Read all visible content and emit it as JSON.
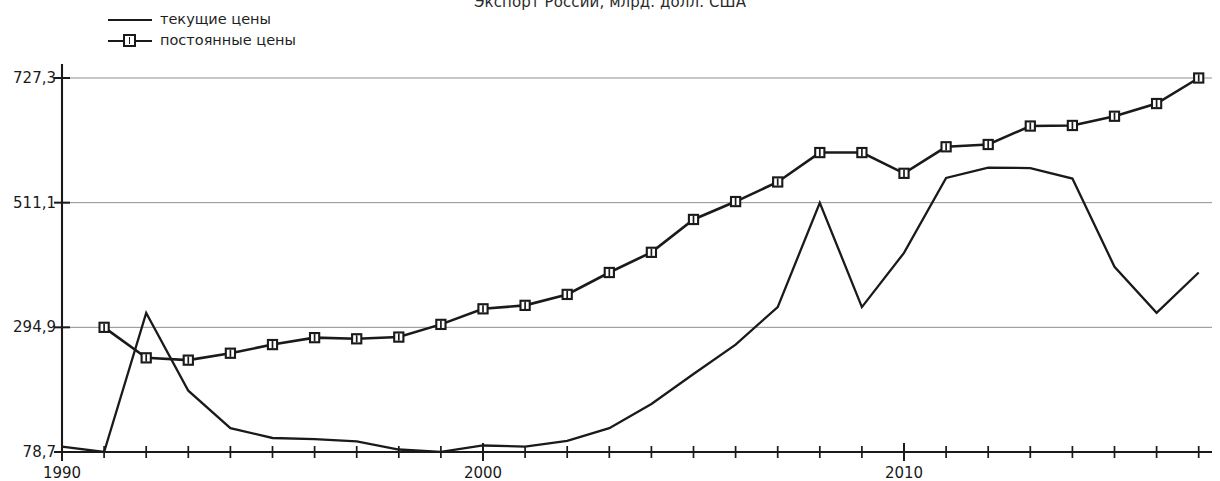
{
  "chart_data": {
    "type": "line",
    "title": "Экспорт России, млрд. долл. США",
    "xlabel": "",
    "ylabel": "",
    "grid": true,
    "legend_position": "top-left",
    "xlim": [
      1990,
      2017.3
    ],
    "ylim": [
      78.7,
      727.3
    ],
    "ytick_labels": [
      "78,7",
      "294,9",
      "511,1",
      "727,3"
    ],
    "ytick_values": [
      78.7,
      294.9,
      511.1,
      727.3
    ],
    "xtick_labels": [
      "1990",
      "2000",
      "2010"
    ],
    "xtick_values": [
      1990,
      2000,
      2010
    ],
    "x": [
      1990,
      1991,
      1992,
      1993,
      1994,
      1995,
      1996,
      1997,
      1998,
      1999,
      2000,
      2001,
      2002,
      2003,
      2004,
      2005,
      2006,
      2007,
      2008,
      2009,
      2010,
      2011,
      2012,
      2013,
      2014,
      2015,
      2016,
      2017
    ],
    "series": [
      {
        "name": "текущие цены",
        "marker": "none",
        "values": [
          88,
          78.7,
          320,
          185,
          120,
          103,
          101,
          97,
          83,
          79,
          90,
          88,
          98,
          120,
          162,
          214,
          265,
          330,
          511,
          330,
          424,
          554,
          572,
          571,
          553,
          400,
          320,
          390
        ]
      },
      {
        "name": "постоянные цены",
        "marker": "square",
        "values": [
          null,
          294.9,
          242,
          238,
          250,
          265,
          277,
          275,
          278,
          300,
          327,
          333,
          352,
          390,
          425,
          482,
          513,
          547,
          598,
          598,
          562,
          608,
          612,
          644,
          645,
          661,
          683,
          727.3
        ]
      }
    ]
  },
  "axis": {
    "y_labels": [
      "727,3",
      "511,1",
      "294,9",
      "78,7"
    ],
    "x_labels": [
      "1990",
      "2000",
      "2010"
    ]
  },
  "legend": {
    "items": [
      {
        "label": "текущие цены",
        "marker": "none"
      },
      {
        "label": "постоянные цены",
        "marker": "square"
      }
    ]
  }
}
